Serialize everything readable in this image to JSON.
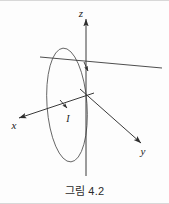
{
  "figure": {
    "caption": "그림 4.2",
    "axes": {
      "x_label": "x",
      "y_label": "y",
      "z_label": "z"
    },
    "current_label": "I",
    "colors": {
      "stroke": "#3a3a3a",
      "loop_stroke": "#555555",
      "text": "#1a1a1a",
      "background": "#fdfdfd",
      "frame": "#d8d8d8"
    },
    "geometry": {
      "origin": [
        86,
        96
      ],
      "z_axis": [
        [
          86,
          18
        ],
        [
          86,
          176
        ]
      ],
      "y_axis": [
        [
          86,
          96
        ],
        [
          140,
          142
        ]
      ],
      "x_axis": [
        [
          86,
          96
        ],
        [
          18,
          118
        ]
      ],
      "diagonal": [
        [
          40,
          57
        ],
        [
          162,
          68
        ]
      ],
      "loop": {
        "cx": 67,
        "cy": 105,
        "rx": 20,
        "ry": 57,
        "rotation": -4
      },
      "current_arrow_top": [
        88,
        69
      ],
      "current_arrow_left": [
        66,
        107
      ]
    }
  }
}
